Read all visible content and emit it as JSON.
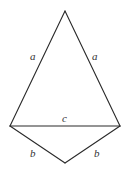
{
  "diagram": {
    "vertices": {
      "apex": {
        "x": 65,
        "y": 11
      },
      "left": {
        "x": 10,
        "y": 126
      },
      "right": {
        "x": 120,
        "y": 126
      },
      "bottom": {
        "x": 65,
        "y": 163
      }
    },
    "edge_color": "#2a2a2a",
    "labels": {
      "left_upper": {
        "text": "a",
        "x": 33,
        "y": 60
      },
      "right_upper": {
        "text": "a",
        "x": 93,
        "y": 60
      },
      "base": {
        "text": "c",
        "x": 63,
        "y": 122
      },
      "left_lower": {
        "text": "b",
        "x": 30,
        "y": 157
      },
      "right_lower": {
        "text": "b",
        "x": 94,
        "y": 157
      }
    }
  }
}
